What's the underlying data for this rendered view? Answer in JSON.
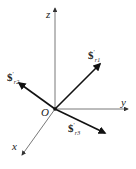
{
  "diagram": {
    "axes": {
      "z": {
        "label": "z"
      },
      "y": {
        "label": "y"
      },
      "x": {
        "label": "x"
      },
      "origin": {
        "label": "O"
      }
    },
    "screws": [
      {
        "symbol": "$",
        "prime": "′",
        "subscript": "r1",
        "sub_main": "r",
        "sub_index": "1"
      },
      {
        "symbol": "$",
        "prime": "′",
        "subscript": "r2",
        "sub_main": "r",
        "sub_index": "2"
      },
      {
        "symbol": "$",
        "prime": "′",
        "subscript": "r3",
        "sub_main": "r",
        "sub_index": "3"
      }
    ],
    "colors": {
      "axis": "#555555",
      "screw": "#111111",
      "background": "#ffffff"
    }
  }
}
